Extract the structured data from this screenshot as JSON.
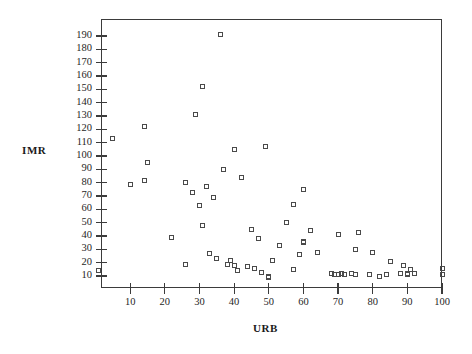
{
  "chart_data": {
    "type": "scatter",
    "title": "",
    "xlabel": "URB",
    "ylabel": "IMR",
    "xlim": [
      0,
      102
    ],
    "ylim": [
      0,
      196
    ],
    "grid": false,
    "legend": null,
    "marker": "open-square",
    "xticks": [
      10,
      20,
      30,
      40,
      50,
      60,
      70,
      80,
      90,
      100
    ],
    "yticks": [
      10,
      20,
      30,
      40,
      50,
      60,
      70,
      80,
      90,
      100,
      110,
      120,
      130,
      140,
      150,
      160,
      170,
      180,
      190
    ],
    "points": [
      {
        "x": 1,
        "y": 14
      },
      {
        "x": 5,
        "y": 113
      },
      {
        "x": 10,
        "y": 79
      },
      {
        "x": 14,
        "y": 82
      },
      {
        "x": 14,
        "y": 122
      },
      {
        "x": 15,
        "y": 95
      },
      {
        "x": 22,
        "y": 39
      },
      {
        "x": 26,
        "y": 80
      },
      {
        "x": 26,
        "y": 19
      },
      {
        "x": 28,
        "y": 73
      },
      {
        "x": 29,
        "y": 131
      },
      {
        "x": 30,
        "y": 63
      },
      {
        "x": 31,
        "y": 152
      },
      {
        "x": 31,
        "y": 48
      },
      {
        "x": 32,
        "y": 77
      },
      {
        "x": 33,
        "y": 27
      },
      {
        "x": 34,
        "y": 69
      },
      {
        "x": 35,
        "y": 23
      },
      {
        "x": 36,
        "y": 191
      },
      {
        "x": 37,
        "y": 90
      },
      {
        "x": 38,
        "y": 19
      },
      {
        "x": 39,
        "y": 22
      },
      {
        "x": 40,
        "y": 18
      },
      {
        "x": 40,
        "y": 105
      },
      {
        "x": 41,
        "y": 14
      },
      {
        "x": 42,
        "y": 84
      },
      {
        "x": 44,
        "y": 17
      },
      {
        "x": 45,
        "y": 45
      },
      {
        "x": 46,
        "y": 16
      },
      {
        "x": 47,
        "y": 38
      },
      {
        "x": 48,
        "y": 13
      },
      {
        "x": 49,
        "y": 107
      },
      {
        "x": 50,
        "y": 9
      },
      {
        "x": 50,
        "y": 10
      },
      {
        "x": 51,
        "y": 22
      },
      {
        "x": 53,
        "y": 33
      },
      {
        "x": 55,
        "y": 50
      },
      {
        "x": 57,
        "y": 15
      },
      {
        "x": 57,
        "y": 64
      },
      {
        "x": 59,
        "y": 26
      },
      {
        "x": 60,
        "y": 75
      },
      {
        "x": 60,
        "y": 36
      },
      {
        "x": 60,
        "y": 35
      },
      {
        "x": 62,
        "y": 44
      },
      {
        "x": 64,
        "y": 28
      },
      {
        "x": 68,
        "y": 12
      },
      {
        "x": 69,
        "y": 11
      },
      {
        "x": 70,
        "y": 41
      },
      {
        "x": 70,
        "y": 11
      },
      {
        "x": 71,
        "y": 12
      },
      {
        "x": 72,
        "y": 11
      },
      {
        "x": 74,
        "y": 12
      },
      {
        "x": 75,
        "y": 11
      },
      {
        "x": 75,
        "y": 30
      },
      {
        "x": 76,
        "y": 43
      },
      {
        "x": 79,
        "y": 11
      },
      {
        "x": 80,
        "y": 28
      },
      {
        "x": 82,
        "y": 10
      },
      {
        "x": 84,
        "y": 11
      },
      {
        "x": 85,
        "y": 21
      },
      {
        "x": 88,
        "y": 12
      },
      {
        "x": 89,
        "y": 18
      },
      {
        "x": 90,
        "y": 12
      },
      {
        "x": 90,
        "y": 11
      },
      {
        "x": 91,
        "y": 15
      },
      {
        "x": 92,
        "y": 12
      },
      {
        "x": 100,
        "y": 11
      },
      {
        "x": 100,
        "y": 16
      }
    ]
  }
}
